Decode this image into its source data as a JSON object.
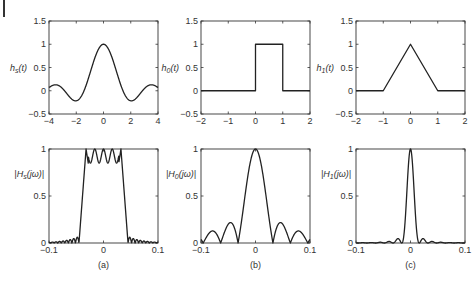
{
  "chart_data": [
    {
      "id": "a_top",
      "type": "line",
      "title": "",
      "ylabel": "h_s(t)",
      "xlabel": "",
      "xlim": [
        -4,
        4
      ],
      "ylim": [
        -0.5,
        1.5
      ],
      "xticks": [
        -4,
        -2,
        0,
        2,
        4
      ],
      "yticks": [
        -0.5,
        0,
        0.5,
        1,
        1.5
      ],
      "grid": false,
      "function": "sinc",
      "description": "sinc-like pulse: peak 1 at t=0, zeros near ±1, minima ≈ -0.22 at ±1.4, side peaks ≈ 0.13 at ±2.5",
      "x": [
        -4,
        -3.5,
        -3,
        -2.5,
        -2,
        -1.5,
        -1,
        -0.5,
        0,
        0.5,
        1,
        1.5,
        2,
        2.5,
        3,
        3.5,
        4
      ],
      "values": [
        0.0,
        -0.09,
        0.0,
        0.13,
        0.0,
        -0.21,
        0.0,
        0.64,
        1.0,
        0.64,
        0.0,
        -0.21,
        0.0,
        0.13,
        0.0,
        -0.09,
        0.0
      ]
    },
    {
      "id": "b_top",
      "type": "line",
      "ylabel": "h_0(t)",
      "xlim": [
        -2,
        2
      ],
      "ylim": [
        -0.5,
        1.5
      ],
      "xticks": [
        -2,
        -1,
        0,
        1,
        2
      ],
      "yticks": [
        -0.5,
        0,
        0.5,
        1,
        1.5
      ],
      "grid": false,
      "description": "rectangular pulse equal to 1 on [0,1], 0 elsewhere",
      "x": [
        -2,
        0,
        0,
        1,
        1,
        2
      ],
      "values": [
        0,
        0,
        1,
        1,
        0,
        0
      ]
    },
    {
      "id": "c_top",
      "type": "line",
      "ylabel": "h_1(t)",
      "xlim": [
        -2,
        2
      ],
      "ylim": [
        -0.5,
        1.5
      ],
      "xticks": [
        -2,
        -1,
        0,
        1,
        2
      ],
      "yticks": [
        -0.5,
        0,
        0.5,
        1,
        1.5
      ],
      "grid": false,
      "description": "triangular pulse peaking at 1 at t=0, zero at ±1",
      "x": [
        -2,
        -1,
        0,
        1,
        2
      ],
      "values": [
        0,
        0,
        1,
        0,
        0
      ]
    },
    {
      "id": "a_bottom",
      "type": "line",
      "ylabel": "|H_s(jω)|",
      "xlim": [
        -0.1,
        0.1
      ],
      "ylim": [
        0,
        1
      ],
      "xticks": [
        -0.1,
        0,
        0.1
      ],
      "yticks": [
        0,
        0.5,
        1
      ],
      "grid": false,
      "description": "near-ideal lowpass with Gibbs ripple: passband |ω|<0.04 between 0.85 and 1, small stopband ripples",
      "x": [
        -0.1,
        -0.05,
        -0.045,
        -0.04,
        -0.032,
        -0.024,
        -0.016,
        -0.008,
        0,
        0.008,
        0.016,
        0.024,
        0.032,
        0.04,
        0.045,
        0.05,
        0.1
      ],
      "values": [
        0.0,
        0.07,
        0.0,
        0.45,
        1.0,
        0.85,
        0.95,
        0.85,
        0.95,
        0.85,
        0.95,
        0.85,
        1.0,
        0.45,
        0.0,
        0.07,
        0.0
      ]
    },
    {
      "id": "b_bottom",
      "type": "line",
      "ylabel": "|H_0(jω)|",
      "xlim": [
        -0.1,
        0.1
      ],
      "ylim": [
        0,
        1
      ],
      "xticks": [
        -0.1,
        0,
        0.1
      ],
      "yticks": [
        0,
        0.5,
        1
      ],
      "grid": false,
      "description": "|sinc| magnitude: main lobe zeros at ±0.032, side lobes ≈0.21 and ≈0.13",
      "x": [
        -0.1,
        -0.095,
        -0.08,
        -0.064,
        -0.048,
        -0.032,
        0,
        0.032,
        0.048,
        0.064,
        0.08,
        0.095,
        0.1
      ],
      "values": [
        0.03,
        0.0,
        0.13,
        0.0,
        0.21,
        0.0,
        1.0,
        0.0,
        0.21,
        0.0,
        0.13,
        0.0,
        0.03
      ]
    },
    {
      "id": "c_bottom",
      "type": "line",
      "ylabel": "|H_1(jω)|",
      "xlim": [
        -0.1,
        0.1
      ],
      "ylim": [
        0,
        1
      ],
      "xticks": [
        -0.1,
        0,
        0.1
      ],
      "yticks": [
        0,
        0.5,
        1
      ],
      "grid": false,
      "description": "sinc^2 magnitude: narrow main lobe zeros at ±0.016, tiny side lobes ≈0.045",
      "x": [
        -0.1,
        -0.04,
        -0.032,
        -0.024,
        -0.016,
        0,
        0.016,
        0.024,
        0.032,
        0.04,
        0.1
      ],
      "values": [
        0.0,
        0.015,
        0.0,
        0.045,
        0.0,
        1.0,
        0.0,
        0.045,
        0.0,
        0.015,
        0.0
      ]
    }
  ],
  "captions": [
    "(a)",
    "(b)",
    "(c)"
  ],
  "labels": {
    "hs_t": "h",
    "hs_sub": "s",
    "h0_sub": "0",
    "h1_sub": "1",
    "t_arg": "(t)",
    "Hs_sub": "s",
    "H0_sub": "0",
    "H1_sub": "1",
    "H_prefix": "|H",
    "jw_arg": "(jω)|"
  },
  "ticks": {
    "top_y": [
      "1.5",
      "1",
      "0.5",
      "0",
      "−0.5"
    ],
    "a_top_x": [
      "−4",
      "−2",
      "0",
      "2",
      "4"
    ],
    "bc_top_x": [
      "−2",
      "−1",
      "0",
      "1",
      "2"
    ],
    "bottom_y": [
      "1",
      "0.5",
      "0"
    ],
    "bottom_x": [
      "−0.1",
      "0",
      "0.1"
    ]
  }
}
